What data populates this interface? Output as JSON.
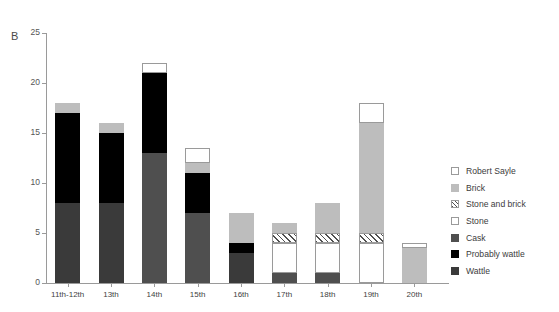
{
  "panel": {
    "label": "B"
  },
  "colors": {
    "wattle": "#3a3a3a",
    "probably_wattle": "#000000",
    "cask": "#4f4f4f",
    "stone": "#ffffff",
    "stone_and_brick": "#ffffff",
    "brick": "#bdbdbd",
    "robert_sayle": "#ffffff",
    "axis": "#9a9a9a",
    "text": "#3c3c3c",
    "background": "#ffffff"
  },
  "legend": {
    "position": "right",
    "items": [
      {
        "label": "Robert Sayle",
        "swatch": "outline",
        "color": "#ffffff"
      },
      {
        "label": "Brick",
        "swatch": "solid",
        "color": "#bdbdbd"
      },
      {
        "label": "Stone and brick",
        "swatch": "hatch",
        "color": "#ffffff"
      },
      {
        "label": "Stone",
        "swatch": "outline",
        "color": "#ffffff"
      },
      {
        "label": "Cask",
        "swatch": "solid",
        "color": "#4f4f4f"
      },
      {
        "label": "Probably wattle",
        "swatch": "solid",
        "color": "#000000"
      },
      {
        "label": "Wattle",
        "swatch": "solid",
        "color": "#3a3a3a"
      }
    ]
  },
  "chart_data": {
    "type": "bar",
    "subtype": "stacked",
    "title": "",
    "xlabel": "",
    "ylabel": "",
    "ylim": [
      0,
      25
    ],
    "yticks": [
      0,
      5,
      10,
      15,
      20,
      25
    ],
    "grid": false,
    "categories": [
      "11th-12th",
      "13th",
      "14th",
      "15th",
      "16th",
      "17th",
      "18th",
      "19th",
      "20th"
    ],
    "series": [
      {
        "name": "Wattle",
        "color": "#3a3a3a",
        "style": "solid",
        "values": [
          8,
          8,
          0,
          0,
          3,
          0,
          0,
          0,
          0
        ]
      },
      {
        "name": "Probably wattle",
        "color": "#000000",
        "style": "solid",
        "values": [
          9,
          7,
          0,
          0,
          1,
          0,
          0,
          0,
          0
        ]
      },
      {
        "name": "Cask",
        "color": "#4f4f4f",
        "style": "solid",
        "values": [
          0,
          0,
          13,
          7,
          0,
          1,
          1,
          0,
          0
        ]
      },
      {
        "name": "Stone",
        "color": "#ffffff",
        "style": "outline",
        "values": [
          0,
          0,
          0,
          0,
          0,
          3,
          3,
          4,
          0
        ]
      },
      {
        "name": "Stone and brick",
        "color": "#ffffff",
        "style": "hatch",
        "values": [
          0,
          0,
          0,
          0,
          0,
          1,
          1,
          1,
          0
        ]
      },
      {
        "name": "Brick",
        "color": "#bdbdbd",
        "style": "solid",
        "values": [
          1,
          1,
          0,
          1,
          3,
          1,
          3,
          11,
          3.5
        ]
      },
      {
        "name": "Robert Sayle",
        "color": "#ffffff",
        "style": "outline",
        "values": [
          0,
          0,
          0,
          0,
          0,
          0,
          0,
          2,
          0.5
        ]
      }
    ],
    "totals": [
      18,
      16,
      21,
      8,
      7,
      6,
      8,
      18,
      4
    ],
    "black_top_note": "14th century bar has a Probably wattle segment reaching 21 with a white (Stone) cap to 22",
    "totals_displayed": [
      18,
      16,
      22,
      13.5,
      8,
      6,
      8,
      18,
      4
    ]
  }
}
